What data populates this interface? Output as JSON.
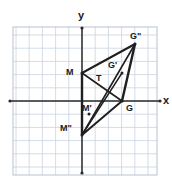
{
  "figure": {
    "kind": "coordinate-grid-triangles",
    "colors": {
      "background": "#ffffff",
      "grid_minor": "#c9d3e0",
      "grid_major": "#b0bccc",
      "axis": "#2a2a2a",
      "shape_stroke": "#1f1f1f"
    },
    "grid": {
      "cell_px": 13.2,
      "left_px": 13,
      "top_px": 27,
      "right_px": 157,
      "bottom_px": 175,
      "cols": 11,
      "rows": 11,
      "show_ticks": false,
      "show_numbers": false
    },
    "axes": {
      "origin_px": [
        82,
        101
      ],
      "x_axis": {
        "label": "x",
        "label_px": [
          163,
          95
        ],
        "arrow_left_px": [
          10,
          101
        ],
        "arrow_right_px": [
          160,
          101
        ]
      },
      "y_axis": {
        "label": "y",
        "label_px": [
          78,
          10
        ],
        "arrow_top_px": [
          82,
          28
        ],
        "arrow_bottom_px": [
          82,
          173
        ]
      }
    },
    "vertices": [
      {
        "name": "M",
        "px": [
          82,
          73
        ],
        "grid": [
          0,
          2
        ],
        "label": "M",
        "label_px": [
          66,
          68
        ]
      },
      {
        "name": "G",
        "px": [
          122,
          101
        ],
        "grid": [
          3,
          0
        ],
        "label": "G",
        "label_px": [
          126,
          104
        ]
      },
      {
        "name": "T",
        "px": [
          100,
          79
        ],
        "grid": [
          1.4,
          1.7
        ],
        "label": "T",
        "label_px": [
          96,
          74
        ]
      },
      {
        "name": "Gp",
        "px": [
          122,
          73
        ],
        "grid": [
          3,
          2
        ],
        "label": "G'",
        "label_px": [
          108,
          61
        ]
      },
      {
        "name": "Gpp",
        "px": [
          135,
          44
        ],
        "grid": [
          4,
          4.3
        ],
        "label": "G\"",
        "label_px": [
          130,
          32
        ]
      },
      {
        "name": "Mp",
        "px": [
          89,
          114
        ],
        "grid": [
          0.5,
          -1
        ],
        "label": "M'",
        "label_px": [
          82,
          104
        ]
      },
      {
        "name": "Mpp",
        "px": [
          82,
          135
        ],
        "grid": [
          0,
          -2.5
        ],
        "label": "M\"",
        "label_px": [
          60,
          124
        ]
      }
    ],
    "segments": [
      {
        "from": "M",
        "to": "G",
        "weight": 1.6
      },
      {
        "from": "M",
        "to": "Mpp",
        "weight": 2.4
      },
      {
        "from": "Mpp",
        "to": "G",
        "weight": 2.0
      },
      {
        "from": "M",
        "to": "Gpp",
        "weight": 2.0
      },
      {
        "from": "Gpp",
        "to": "G",
        "weight": 2.4
      },
      {
        "from": "Mpp",
        "to": "Gpp",
        "weight": 1.6
      },
      {
        "from": "Mpp",
        "to": "Gp",
        "weight": 1.4
      }
    ]
  }
}
